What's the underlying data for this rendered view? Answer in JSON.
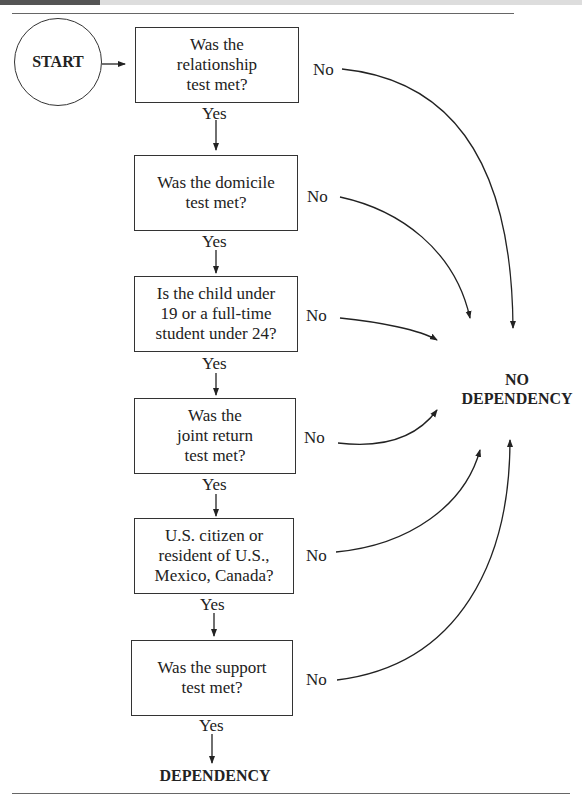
{
  "start": {
    "label": "START"
  },
  "steps": [
    {
      "question": "Was the relationship test met?",
      "lines": [
        "Was the",
        "relationship",
        "test met?"
      ],
      "yes": "Yes",
      "no": "No"
    },
    {
      "question": "Was the domicile test met?",
      "lines": [
        "Was the domicile",
        "test met?"
      ],
      "yes": "Yes",
      "no": "No"
    },
    {
      "question": "Is the child under 19 or a full-time student under 24?",
      "lines": [
        "Is the child under",
        "19 or a full-time",
        "student under 24?"
      ],
      "yes": "Yes",
      "no": "No"
    },
    {
      "question": "Was the joint return test met?",
      "lines": [
        "Was the",
        "joint return",
        "test met?"
      ],
      "yes": "Yes",
      "no": "No"
    },
    {
      "question": "U.S. citizen or resident of U.S., Mexico, Canada?",
      "lines": [
        "U.S. citizen or",
        "resident of U.S.,",
        "Mexico, Canada?"
      ],
      "yes": "Yes",
      "no": "No"
    },
    {
      "question": "Was the support test met?",
      "lines": [
        "Was the support",
        "test met?"
      ],
      "yes": "Yes",
      "no": "No"
    }
  ],
  "outcomes": {
    "no_dependency": [
      "NO",
      "DEPENDENCY"
    ],
    "dependency": "DEPENDENCY"
  }
}
